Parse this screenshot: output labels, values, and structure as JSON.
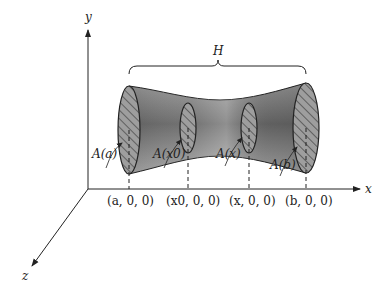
{
  "figure": {
    "axes": {
      "x_label": "x",
      "y_label": "y",
      "z_label": "z"
    },
    "brace_label": "H",
    "cross_sections": [
      {
        "label": "A(a)",
        "point": "(a, 0, 0)"
      },
      {
        "label": "A(x0)",
        "point": "(x0, 0, 0)"
      },
      {
        "label": "A(x)",
        "point": "(x, 0, 0)"
      },
      {
        "label": "A(b)",
        "point": "(b, 0, 0)"
      }
    ],
    "colors": {
      "solid_dark": "#6e6e6e",
      "solid_light": "#b8b8b8",
      "line": "#222222",
      "background": "#ffffff"
    }
  }
}
